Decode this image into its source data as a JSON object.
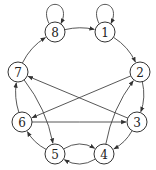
{
  "diagram": {
    "type": "directed-graph",
    "nodes": [
      {
        "id": "1",
        "label": "1"
      },
      {
        "id": "2",
        "label": "2"
      },
      {
        "id": "3",
        "label": "3"
      },
      {
        "id": "4",
        "label": "4"
      },
      {
        "id": "5",
        "label": "5"
      },
      {
        "id": "6",
        "label": "6"
      },
      {
        "id": "7",
        "label": "7"
      },
      {
        "id": "8",
        "label": "8"
      }
    ],
    "edges": [
      {
        "from": "8",
        "to": "8"
      },
      {
        "from": "1",
        "to": "1"
      },
      {
        "from": "8",
        "to": "1"
      },
      {
        "from": "1",
        "to": "2"
      },
      {
        "from": "2",
        "to": "3"
      },
      {
        "from": "3",
        "to": "4"
      },
      {
        "from": "4",
        "to": "2"
      },
      {
        "from": "4",
        "to": "5"
      },
      {
        "from": "5",
        "to": "4"
      },
      {
        "from": "5",
        "to": "6"
      },
      {
        "from": "6",
        "to": "7"
      },
      {
        "from": "7",
        "to": "8"
      },
      {
        "from": "7",
        "to": "5"
      },
      {
        "from": "3",
        "to": "7"
      },
      {
        "from": "2",
        "to": "6"
      },
      {
        "from": "6",
        "to": "3"
      }
    ]
  }
}
